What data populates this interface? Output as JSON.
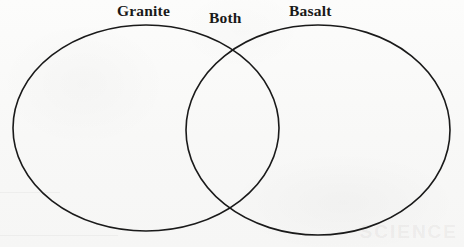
{
  "page": {
    "background_color": "#fbfbfa",
    "stroke_color": "#1a1a1a",
    "text_color": "#191919",
    "width": 464,
    "height": 247
  },
  "diagram": {
    "type": "venn-2-set",
    "left_set": {
      "label": "Granite",
      "shape": "ellipse",
      "cx": 146,
      "cy": 128,
      "rx": 133,
      "ry": 103
    },
    "right_set": {
      "label": "Basalt",
      "shape": "ellipse",
      "cx": 318,
      "cy": 130,
      "rx": 132,
      "ry": 105
    },
    "intersection": {
      "label": "Both"
    },
    "labels": [
      {
        "name": "granite",
        "text": "Granite"
      },
      {
        "name": "both",
        "text": "Both"
      },
      {
        "name": "basalt",
        "text": "Basalt"
      }
    ],
    "entries": {
      "left_only": [],
      "intersection": [],
      "right_only": []
    }
  },
  "artifacts": {
    "scan_ghost_right": "SCIENCE"
  }
}
